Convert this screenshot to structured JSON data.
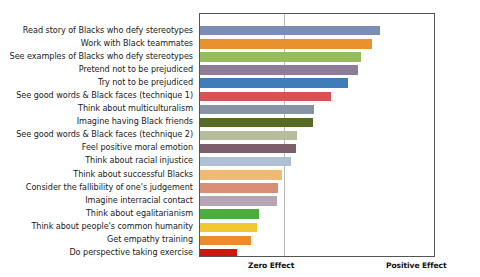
{
  "chart_data": {
    "type": "bar",
    "orientation": "horizontal",
    "title": "",
    "subtitle": "",
    "xlabel": "",
    "ylabel": "",
    "grid": true,
    "legend": false,
    "legend_position": "none",
    "axis_annotations": {
      "zero": "Zero Effect",
      "positive": "Positive Effect"
    },
    "xlim": [
      0,
      1
    ],
    "zero_position": 0.357,
    "note": "Bars are drawn from the left edge of the plot frame; the vertical gridline marks Zero Effect and the right frame edge marks Positive Effect. Values below are bar-end positions as a fraction of the plot width.",
    "categories": [
      "Read story of Blacks who defy stereotypes",
      "Work with Black teammates",
      "See examples of Blacks who defy stereotypes",
      "Pretend not to be prejudiced",
      "Try not to be prejudiced",
      "See good words & Black faces (technique 1)",
      "Think about multiculturalism",
      "Imagine having Black friends",
      "See good words & Black faces (technique 2)",
      "Feel positive moral emotion",
      "Think about racial injustice",
      "Think about successful Blacks",
      "Consider the fallibility of one's judgement",
      "Imagine interracial contact",
      "Think about egalitarianism",
      "Think about people's common humanity",
      "Get empathy training",
      "Do perspective taking exercise"
    ],
    "values": [
      0.771,
      0.733,
      0.686,
      0.674,
      0.632,
      0.56,
      0.488,
      0.483,
      0.415,
      0.411,
      0.39,
      0.352,
      0.335,
      0.331,
      0.25,
      0.242,
      0.216,
      0.157
    ],
    "colors": [
      "#7b8cb5",
      "#e8922f",
      "#96bc5f",
      "#8e7d99",
      "#3e7cba",
      "#d85254",
      "#8794a6",
      "#566c24",
      "#b6bd9c",
      "#7b5f6b",
      "#adc0d4",
      "#f2ba70",
      "#d98f75",
      "#b6a6b5",
      "#4aad3c",
      "#f2c832",
      "#ee8b2a",
      "#cc1910"
    ]
  }
}
